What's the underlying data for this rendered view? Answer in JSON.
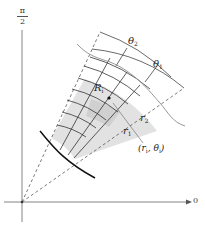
{
  "figure": {
    "axis_labels": {
      "vertical_num": "π",
      "vertical_den": "2",
      "horizontal": "0"
    },
    "labels": {
      "theta2": "θ",
      "theta2_sub": "2",
      "theta1": "θ",
      "theta1_sub": "1",
      "region": "R",
      "region_sub": "i",
      "r2": "r",
      "r2_sub": "2",
      "r1": "r",
      "r1_sub": "1",
      "point": "(r",
      "point_sub1": "i",
      "point_mid": ", θ",
      "point_sub2": "i",
      "point_end": ")"
    },
    "colors": {
      "shade": "#e3e3e3",
      "shade_dark": "#d2d2d2",
      "grid": "#333333",
      "curve": "#888888"
    }
  }
}
